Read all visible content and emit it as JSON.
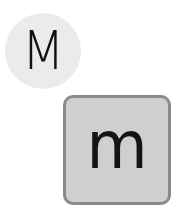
{
  "key_preview": {
    "character": "M",
    "background_color": "#ebebeb"
  },
  "key": {
    "character": "m",
    "fill_color": "#cfcfcf",
    "border_color": "#8a8a8a"
  }
}
